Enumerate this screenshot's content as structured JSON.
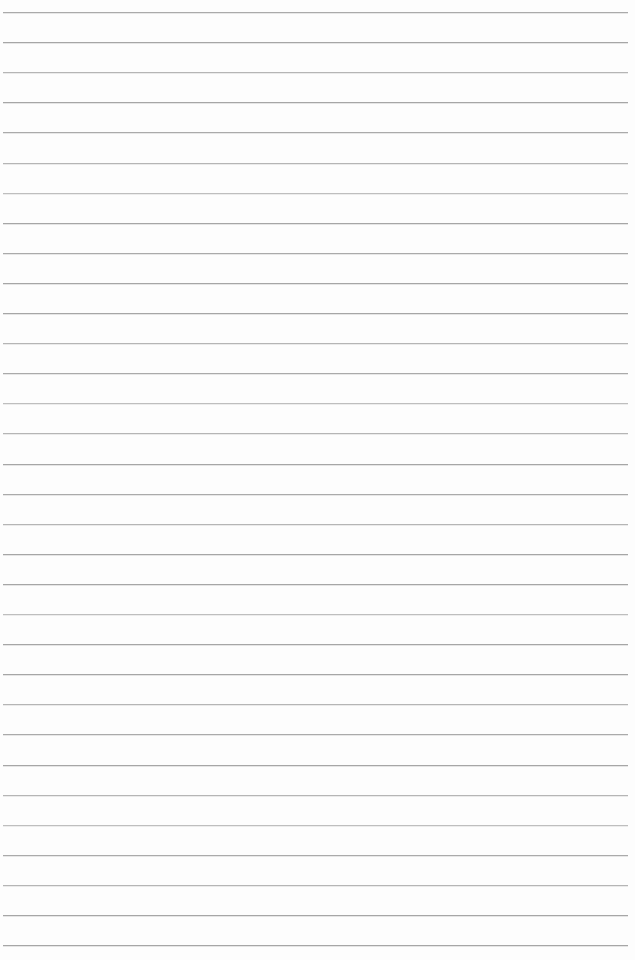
{
  "page": {
    "type": "blank-ruled-notebook-page",
    "background_color": "#fdfdfd",
    "ruled_lines": {
      "count": 32,
      "color": "#a6a6a6",
      "first_line_top_px": 12,
      "spacing_px": 30.1,
      "left_inset_px": 3,
      "right_inset_px": 7,
      "thickness_px": 1
    },
    "text_content": ""
  }
}
